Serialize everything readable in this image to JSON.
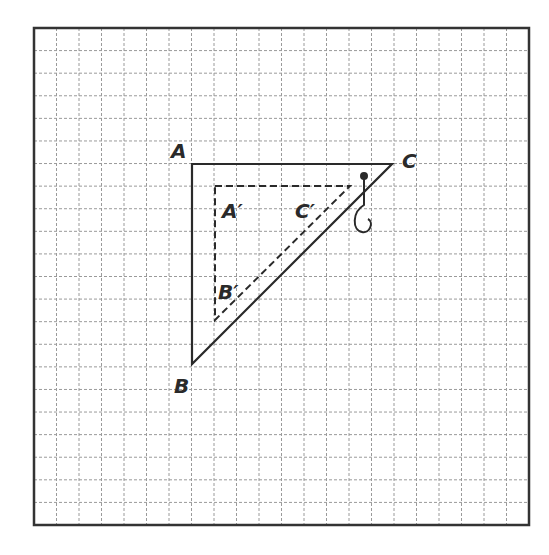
{
  "figure": {
    "grid": {
      "columns": 22,
      "rows": 22,
      "cell_px": 22.5,
      "origin": [
        34,
        28
      ]
    },
    "colors": {
      "grid": "#9a9a9a",
      "border": "#333333",
      "lines": "#2a2a2a"
    },
    "original_triangle": {
      "vertices": {
        "A": [
          192,
          164
        ],
        "B": [
          192,
          364
        ],
        "C": [
          392,
          164
        ]
      },
      "style": "solid"
    },
    "image_triangle": {
      "vertices": {
        "A'": [
          215,
          186
        ],
        "B'": [
          215,
          320
        ],
        "C'": [
          350,
          186
        ]
      },
      "style": "dashed"
    },
    "labels": {
      "A": "A",
      "B": "B",
      "C": "C",
      "A_prime": "A′",
      "B_prime": "B′",
      "C_prime": "C′"
    },
    "compass_icon": {
      "pivot": [
        364,
        176
      ]
    }
  }
}
